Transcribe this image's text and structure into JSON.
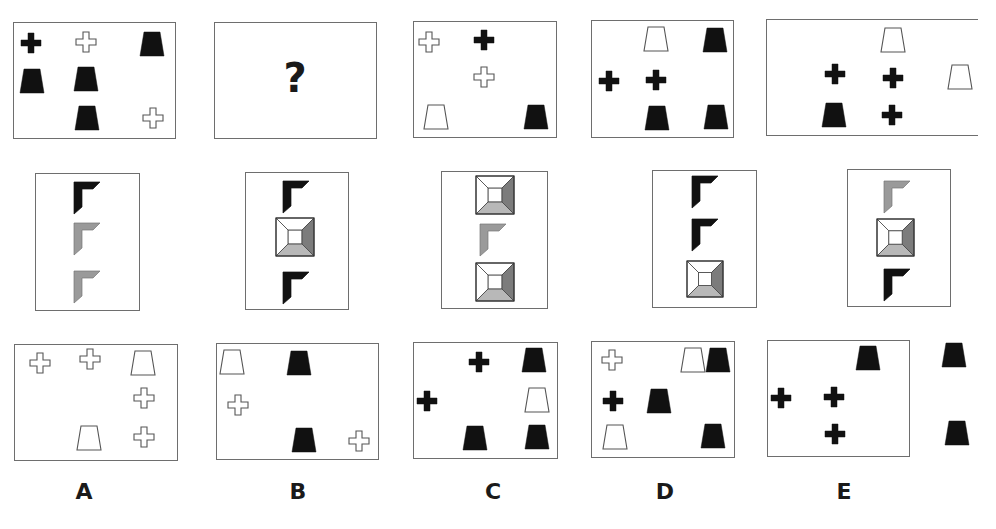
{
  "puzzle": {
    "question_mark": "?",
    "colors": {
      "black": "#111111",
      "gray": "#9a9a9a",
      "gray_dark": "#7c7c7c",
      "gray_light": "#b8b8b8",
      "outline": "#555555",
      "border": "#6e6e6e"
    },
    "row1": [
      {
        "id": "top-1",
        "x": 13,
        "y": 22,
        "w": 163,
        "h": 117,
        "shapes": [
          {
            "type": "cross",
            "fill": "black",
            "cx": 31,
            "cy": 43
          },
          {
            "type": "cross",
            "fill": "white",
            "cx": 86,
            "cy": 42
          },
          {
            "type": "trap",
            "fill": "black",
            "cx": 152,
            "cy": 44
          },
          {
            "type": "trap",
            "fill": "black",
            "cx": 32,
            "cy": 81
          },
          {
            "type": "trap",
            "fill": "black",
            "cx": 86,
            "cy": 79
          },
          {
            "type": "trap",
            "fill": "black",
            "cx": 87,
            "cy": 118
          },
          {
            "type": "cross",
            "fill": "white",
            "cx": 153,
            "cy": 118
          }
        ]
      },
      {
        "id": "top-2-question",
        "x": 214,
        "y": 22,
        "w": 163,
        "h": 117,
        "question": true
      },
      {
        "id": "top-3",
        "x": 413,
        "y": 21,
        "w": 144,
        "h": 117,
        "shapes": [
          {
            "type": "cross",
            "fill": "white",
            "cx": 429,
            "cy": 42
          },
          {
            "type": "cross",
            "fill": "black",
            "cx": 484,
            "cy": 40
          },
          {
            "type": "cross",
            "fill": "white",
            "cx": 484,
            "cy": 77
          },
          {
            "type": "trap",
            "fill": "white",
            "cx": 436,
            "cy": 117
          },
          {
            "type": "trap",
            "fill": "black",
            "cx": 536,
            "cy": 117
          }
        ]
      },
      {
        "id": "top-4",
        "x": 591,
        "y": 20,
        "w": 143,
        "h": 118,
        "shapes": [
          {
            "type": "trap",
            "fill": "white",
            "cx": 656,
            "cy": 39
          },
          {
            "type": "trap",
            "fill": "black",
            "cx": 715,
            "cy": 40
          },
          {
            "type": "cross",
            "fill": "black",
            "cx": 609,
            "cy": 81
          },
          {
            "type": "cross",
            "fill": "black",
            "cx": 656,
            "cy": 80
          },
          {
            "type": "trap",
            "fill": "black",
            "cx": 657,
            "cy": 118
          },
          {
            "type": "trap",
            "fill": "black",
            "cx": 716,
            "cy": 117
          }
        ]
      },
      {
        "id": "top-5",
        "x": 766,
        "y": 19,
        "w": 212,
        "h": 117,
        "open_right": true,
        "shapes": [
          {
            "type": "trap",
            "fill": "white",
            "cx": 893,
            "cy": 40
          },
          {
            "type": "cross",
            "fill": "black",
            "cx": 835,
            "cy": 74
          },
          {
            "type": "cross",
            "fill": "black",
            "cx": 893,
            "cy": 78
          },
          {
            "type": "trap",
            "fill": "white",
            "cx": 960,
            "cy": 77
          },
          {
            "type": "trap",
            "fill": "black",
            "cx": 834,
            "cy": 115
          },
          {
            "type": "cross",
            "fill": "black",
            "cx": 892,
            "cy": 115
          }
        ]
      }
    ],
    "row2": [
      {
        "id": "mid-1",
        "x": 35,
        "y": 173,
        "w": 105,
        "h": 138,
        "shapes": [
          {
            "type": "corner",
            "fill": "black",
            "x": 73,
            "y": 181
          },
          {
            "type": "corner",
            "fill": "gray",
            "x": 73,
            "y": 222
          },
          {
            "type": "corner",
            "fill": "gray",
            "x": 73,
            "y": 270
          }
        ]
      },
      {
        "id": "mid-2",
        "x": 245,
        "y": 172,
        "w": 104,
        "h": 138,
        "shapes": [
          {
            "type": "corner",
            "fill": "black",
            "x": 282,
            "y": 180
          },
          {
            "type": "pyramid",
            "x": 275,
            "y": 217,
            "size": 38
          },
          {
            "type": "corner",
            "fill": "black",
            "x": 282,
            "y": 271
          }
        ]
      },
      {
        "id": "mid-3",
        "x": 441,
        "y": 171,
        "w": 107,
        "h": 138,
        "shapes": [
          {
            "type": "pyramid",
            "x": 475,
            "y": 175,
            "size": 38
          },
          {
            "type": "corner",
            "fill": "gray",
            "x": 479,
            "y": 223
          },
          {
            "type": "pyramid",
            "x": 475,
            "y": 262,
            "size": 38
          }
        ]
      },
      {
        "id": "mid-4",
        "x": 652,
        "y": 170,
        "w": 105,
        "h": 138,
        "shapes": [
          {
            "type": "corner",
            "fill": "black",
            "x": 691,
            "y": 175
          },
          {
            "type": "corner",
            "fill": "black",
            "x": 691,
            "y": 218
          },
          {
            "type": "pyramid",
            "x": 686,
            "y": 260,
            "size": 36
          }
        ]
      },
      {
        "id": "mid-5",
        "x": 847,
        "y": 169,
        "w": 104,
        "h": 138,
        "shapes": [
          {
            "type": "corner",
            "fill": "gray",
            "x": 883,
            "y": 180
          },
          {
            "type": "pyramid",
            "x": 876,
            "y": 218,
            "size": 37
          },
          {
            "type": "corner",
            "fill": "black",
            "x": 883,
            "y": 268
          }
        ]
      }
    ],
    "row3": [
      {
        "id": "option-a",
        "label": "A",
        "x": 14,
        "y": 344,
        "w": 164,
        "h": 117,
        "shapes": [
          {
            "type": "cross",
            "fill": "white",
            "cx": 40,
            "cy": 363
          },
          {
            "type": "cross",
            "fill": "white",
            "cx": 90,
            "cy": 359
          },
          {
            "type": "trap",
            "fill": "white",
            "cx": 143,
            "cy": 363
          },
          {
            "type": "cross",
            "fill": "white",
            "cx": 144,
            "cy": 398
          },
          {
            "type": "trap",
            "fill": "white",
            "cx": 89,
            "cy": 438
          },
          {
            "type": "cross",
            "fill": "white",
            "cx": 144,
            "cy": 437
          }
        ]
      },
      {
        "id": "option-b",
        "label": "B",
        "x": 216,
        "y": 343,
        "w": 163,
        "h": 117,
        "shapes": [
          {
            "type": "trap",
            "fill": "white",
            "cx": 232,
            "cy": 362
          },
          {
            "type": "trap",
            "fill": "black",
            "cx": 299,
            "cy": 363
          },
          {
            "type": "cross",
            "fill": "white",
            "cx": 238,
            "cy": 405
          },
          {
            "type": "trap",
            "fill": "black",
            "cx": 304,
            "cy": 440
          },
          {
            "type": "cross",
            "fill": "white",
            "cx": 359,
            "cy": 441
          }
        ]
      },
      {
        "id": "option-c",
        "label": "C",
        "x": 413,
        "y": 342,
        "w": 145,
        "h": 117,
        "shapes": [
          {
            "type": "cross",
            "fill": "black",
            "cx": 479,
            "cy": 362
          },
          {
            "type": "trap",
            "fill": "black",
            "cx": 534,
            "cy": 360
          },
          {
            "type": "cross",
            "fill": "black",
            "cx": 427,
            "cy": 401
          },
          {
            "type": "trap",
            "fill": "white",
            "cx": 537,
            "cy": 400
          },
          {
            "type": "trap",
            "fill": "black",
            "cx": 475,
            "cy": 438
          },
          {
            "type": "trap",
            "fill": "black",
            "cx": 537,
            "cy": 437
          }
        ]
      },
      {
        "id": "option-d",
        "label": "D",
        "x": 591,
        "y": 341,
        "w": 144,
        "h": 117,
        "shapes": [
          {
            "type": "cross",
            "fill": "white",
            "cx": 612,
            "cy": 360
          },
          {
            "type": "trap",
            "fill": "white",
            "cx": 693,
            "cy": 360
          },
          {
            "type": "trap",
            "fill": "black",
            "cx": 718,
            "cy": 360
          },
          {
            "type": "cross",
            "fill": "black",
            "cx": 613,
            "cy": 401
          },
          {
            "type": "trap",
            "fill": "black",
            "cx": 659,
            "cy": 401
          },
          {
            "type": "trap",
            "fill": "white",
            "cx": 615,
            "cy": 437
          },
          {
            "type": "trap",
            "fill": "black",
            "cx": 713,
            "cy": 436
          }
        ]
      },
      {
        "id": "option-e",
        "label": "E",
        "x": 767,
        "y": 340,
        "w": 143,
        "h": 117,
        "shapes": [
          {
            "type": "trap",
            "fill": "black",
            "cx": 868,
            "cy": 358
          },
          {
            "type": "trap",
            "fill": "black",
            "cx": 954,
            "cy": 355
          },
          {
            "type": "cross",
            "fill": "black",
            "cx": 781,
            "cy": 398
          },
          {
            "type": "cross",
            "fill": "black",
            "cx": 834,
            "cy": 397
          },
          {
            "type": "cross",
            "fill": "black",
            "cx": 835,
            "cy": 434
          },
          {
            "type": "trap",
            "fill": "black",
            "cx": 957,
            "cy": 433
          }
        ]
      }
    ],
    "labels": [
      {
        "text": "A",
        "x": 74,
        "y": 479
      },
      {
        "text": "B",
        "x": 288,
        "y": 479
      },
      {
        "text": "C",
        "x": 483,
        "y": 479
      },
      {
        "text": "D",
        "x": 655,
        "y": 479
      },
      {
        "text": "E",
        "x": 834,
        "y": 479
      }
    ]
  }
}
